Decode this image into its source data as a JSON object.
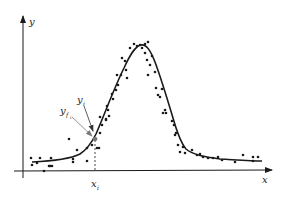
{
  "figure": {
    "x_axis_label": "x",
    "y_axis_label": "y",
    "annotations": {
      "observed_point_label": "y",
      "observed_point_sub": "i",
      "fitted_point_label": "y",
      "fitted_point_sub": "f",
      "fitted_point_subsub": "i",
      "x_marker_label": "x",
      "x_marker_sub": "i"
    }
  },
  "colors": {
    "ink": "#1a1a1a",
    "arrow": "#555555",
    "background": "#ffffff"
  },
  "chart_data": {
    "type": "scatter",
    "title": "",
    "xlabel": "x",
    "ylabel": "y",
    "grid": false,
    "legend": "none",
    "fitted_curve": {
      "shape": "gaussian",
      "baseline_px": 162,
      "peak_px": [
        141,
        45
      ],
      "points_px": [
        [
          28,
          160
        ],
        [
          50,
          159
        ],
        [
          65,
          157
        ],
        [
          78,
          153
        ],
        [
          86,
          146
        ],
        [
          92,
          139
        ],
        [
          98,
          128
        ],
        [
          106,
          110
        ],
        [
          114,
          90
        ],
        [
          122,
          72
        ],
        [
          130,
          56
        ],
        [
          137,
          47
        ],
        [
          141,
          45
        ],
        [
          146,
          47
        ],
        [
          152,
          56
        ],
        [
          158,
          72
        ],
        [
          165,
          92
        ],
        [
          172,
          114
        ],
        [
          178,
          132
        ],
        [
          184,
          145
        ],
        [
          190,
          152
        ],
        [
          200,
          156
        ],
        [
          215,
          158
        ],
        [
          235,
          160
        ],
        [
          260,
          161
        ]
      ]
    },
    "series": [
      {
        "name": "observations",
        "points_px": [
          [
            31,
            158
          ],
          [
            40,
            158
          ],
          [
            51,
            158
          ],
          [
            32,
            165
          ],
          [
            37,
            163
          ],
          [
            44,
            171
          ],
          [
            49,
            166
          ],
          [
            50,
            166
          ],
          [
            52,
            166
          ],
          [
            73,
            159
          ],
          [
            73,
            162
          ],
          [
            69,
            139
          ],
          [
            77,
            150
          ],
          [
            87,
            148
          ],
          [
            87,
            161
          ],
          [
            92,
            145
          ],
          [
            97,
            148
          ],
          [
            99,
            148
          ],
          [
            96,
            139
          ],
          [
            100,
            133
          ],
          [
            100,
            117
          ],
          [
            102,
            125
          ],
          [
            106,
            119
          ],
          [
            106,
            120
          ],
          [
            108,
            110
          ],
          [
            107,
            106
          ],
          [
            109,
            116
          ],
          [
            112,
            94
          ],
          [
            113,
            99
          ],
          [
            116,
            90
          ],
          [
            118,
            85
          ],
          [
            117,
            75
          ],
          [
            121,
            75
          ],
          [
            122,
            58
          ],
          [
            125,
            61
          ],
          [
            126,
            70
          ],
          [
            127,
            78
          ],
          [
            130,
            48
          ],
          [
            134,
            44
          ],
          [
            137,
            46
          ],
          [
            140,
            45
          ],
          [
            142,
            48
          ],
          [
            145,
            44
          ],
          [
            148,
            42
          ],
          [
            145,
            53
          ],
          [
            147,
            60
          ],
          [
            150,
            65
          ],
          [
            152,
            56
          ],
          [
            148,
            75
          ],
          [
            155,
            72
          ],
          [
            156,
            88
          ],
          [
            158,
            95
          ],
          [
            160,
            97
          ],
          [
            162,
            89
          ],
          [
            165,
            110
          ],
          [
            163,
            113
          ],
          [
            166,
            113
          ],
          [
            172,
            121
          ],
          [
            174,
            125
          ],
          [
            175,
            135
          ],
          [
            176,
            133
          ],
          [
            178,
            145
          ],
          [
            183,
            147
          ],
          [
            180,
            152
          ],
          [
            185,
            153
          ],
          [
            192,
            150
          ],
          [
            197,
            155
          ],
          [
            200,
            154
          ],
          [
            203,
            157
          ],
          [
            208,
            158
          ],
          [
            213,
            158
          ],
          [
            218,
            157
          ],
          [
            222,
            160
          ],
          [
            235,
            162
          ],
          [
            243,
            155
          ],
          [
            253,
            157
          ],
          [
            253,
            161
          ],
          [
            258,
            157
          ]
        ]
      }
    ],
    "marked_point": {
      "x_label": "x_i",
      "observed_label": "y_i",
      "fitted_label": "y_f_i",
      "x_px": 95,
      "fitted_y_px": 139
    },
    "xlim": [
      0,
      1
    ],
    "ylim": [
      0,
      1
    ]
  }
}
